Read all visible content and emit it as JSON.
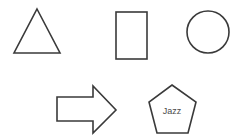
{
  "diagram": {
    "shapes": [
      {
        "type": "triangle",
        "label": ""
      },
      {
        "type": "rectangle",
        "label": ""
      },
      {
        "type": "circle",
        "label": ""
      },
      {
        "type": "arrow-right",
        "label": ""
      },
      {
        "type": "pentagon",
        "label": "Jazz"
      }
    ],
    "stroke_color": "#3a3a3a",
    "background": "#ffffff"
  }
}
